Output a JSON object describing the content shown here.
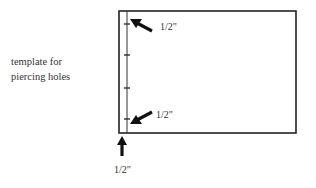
{
  "caption": {
    "line1": "template for",
    "line2": "piercing holes"
  },
  "labels": {
    "top_margin": "1/2\"",
    "bottom_margin": "1/2\"",
    "side_margin": "1/2\""
  },
  "diagram": {
    "rect": {
      "x": 119,
      "y": 11,
      "width": 177,
      "height": 122
    },
    "inner_line_x": 127,
    "hole_ticks_y": [
      24,
      55,
      88,
      119
    ],
    "stroke_color": "#222222"
  }
}
